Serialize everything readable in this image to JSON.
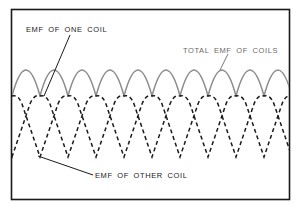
{
  "diagram": {
    "labels": {
      "one_coil": "EMF OF ONE COIL",
      "total": "TOTAL EMF OF COILS",
      "other_coil": "EMF OF OTHER COIL"
    },
    "colors": {
      "frame": "#1a1a1a",
      "total_curve": "#8c8c8c",
      "coil_curves": "#1a1a1a",
      "background": "#ffffff"
    }
  }
}
